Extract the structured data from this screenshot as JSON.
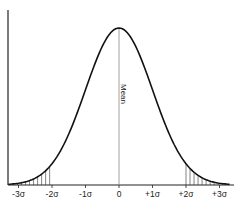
{
  "chart_data": {
    "type": "line",
    "title": "",
    "subtitle": "",
    "xlabel": "",
    "ylabel": "",
    "categories": [
      "-3σ",
      "-2σ",
      "-1σ",
      "0",
      "+1σ",
      "+2σ",
      "+3σ"
    ],
    "x": [
      -3,
      -2,
      -1,
      0,
      1,
      2,
      3
    ],
    "series": [
      {
        "name": "Normal density",
        "values": [
          0.0044,
          0.054,
          0.242,
          0.399,
          0.242,
          0.054,
          0.0044
        ]
      }
    ],
    "xlim": [
      -3.3,
      3.3
    ],
    "ylim": [
      0,
      0.42
    ],
    "grid": false,
    "legend": null,
    "annotations": [
      {
        "text": "Mean",
        "x": 0,
        "orientation": "vertical"
      }
    ],
    "shaded_regions": [
      {
        "from": -3.3,
        "to": -2,
        "style": "vertical-hatch"
      },
      {
        "from": 2,
        "to": 3.3,
        "style": "vertical-hatch"
      }
    ]
  },
  "labels": {
    "mean": "Mean",
    "ticks": [
      "-3σ",
      "-2σ",
      "-1σ",
      "0",
      "+1σ",
      "+2σ",
      "+3σ"
    ]
  },
  "colors": {
    "curve": "#111111",
    "axis": "#222222",
    "mean_line": "#888888",
    "hatch": "#333333"
  }
}
